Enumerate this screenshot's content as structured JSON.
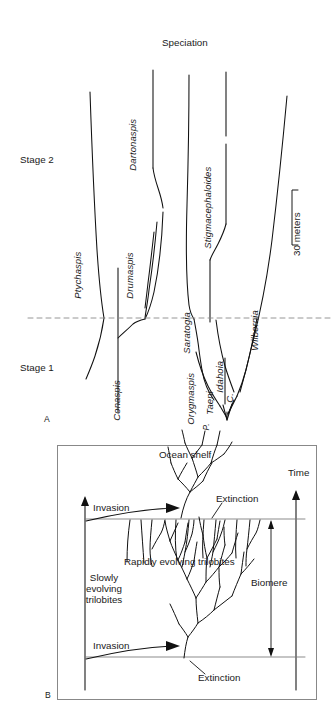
{
  "figure": {
    "panels": [
      {
        "letter": "A",
        "title": "Speciation",
        "scale_bar_label": "30 meters",
        "stage_labels": [
          "Stage 2",
          "Stage 1"
        ],
        "taxa": [
          "Ptychaspis",
          "Conaspis",
          "Drumaspis",
          "Dartonaspis",
          "Saratogia",
          "Stigmacephaloides",
          "Orygmaspis",
          "Taeni",
          "C.",
          "Idahoia",
          "Wilbernia",
          "P."
        ],
        "boundary_line_style": "dashed"
      },
      {
        "letter": "B",
        "title": "Ocean shelf",
        "axis_label": "Time",
        "bracket_label": "Biomere",
        "left_label": "Slowly\nevolving\ntrilobites",
        "left_label_lines": [
          "Slowly",
          "evolving",
          "trilobites"
        ],
        "middle_label": "Rapidly evolving trilobites",
        "events": [
          "Invasion",
          "Extinction",
          "Invasion",
          "Extinction"
        ]
      }
    ]
  },
  "panelA": {
    "letter": "A",
    "title": "Speciation",
    "stage2": "Stage 2",
    "stage1": "Stage 1",
    "scale": "30 meters",
    "t_ptychaspis": "Ptychaspis",
    "t_conaspis": "Conaspis",
    "t_drumaspis": "Drumaspis",
    "t_dartonaspis": "Dartonaspis",
    "t_saratogia": "Saratogia",
    "t_stigmacephaloides": "Stigmacephaloides",
    "t_orygmaspis": "Orygmaspis",
    "t_taeni": "Taeni",
    "t_c": "C.",
    "t_idahoia": "Idahoia",
    "t_wilbernia": "Wilbernia",
    "t_p": "P."
  },
  "panelB": {
    "letter": "B",
    "ocean_shelf": "Ocean shelf",
    "time": "Time",
    "invasion_top": "Invasion",
    "invasion_bottom": "Invasion",
    "extinction_top": "Extinction",
    "extinction_bottom": "Extinction",
    "rapidly": "Rapidly evolving trilobites",
    "slowly_1": "Slowly",
    "slowly_2": "evolving",
    "slowly_3": "trilobites",
    "biomere": "Biomere"
  },
  "colors": {
    "ink": "#1a1a1a",
    "line": "#111111",
    "frame": "#777777",
    "background": "#ffffff"
  }
}
